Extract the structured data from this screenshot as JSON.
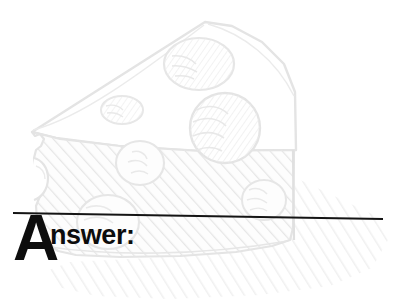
{
  "page": {
    "width": 402,
    "height": 301,
    "background_color": "#ffffff",
    "kind": "worksheet-answer-heading"
  },
  "heading": {
    "full_text": "Answer:",
    "dropcap": "A",
    "rest": "nswer:",
    "text_color": "#0d0d0d",
    "dropcap_font_size_px": 64,
    "rest_font_size_px": 27
  },
  "divider": {
    "name": "answer-rule",
    "color": "#141414",
    "thickness_px": 2,
    "x1": 13,
    "y1": 213,
    "x2": 383,
    "y2": 219,
    "slanted": true
  },
  "illustration": {
    "subject": "cheese-wedge",
    "style": "hand-drawn line art watermark",
    "line_color": "#e2e2e2",
    "hatch_color": "#ebebeb",
    "shadow_color": "#f2f2f2",
    "hole_count": 7,
    "description": "Faint grey sketch of a triangular wedge of swiss cheese with round holes, diagonally hatched front face and a hatched cast shadow to the lower right."
  },
  "colors": {
    "ink": "#0d0d0d",
    "rule": "#141414",
    "art_line": "#e2e2e2",
    "art_hatch": "#ebebeb",
    "art_shadow": "#f2f2f2",
    "paper": "#ffffff"
  }
}
